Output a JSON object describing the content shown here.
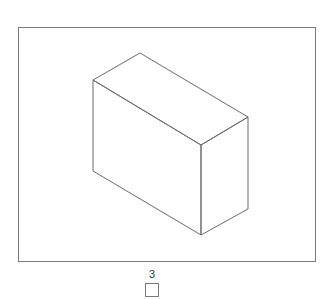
{
  "figure": {
    "stroke_color": "#6b6b6b",
    "frame_color": "#7a7a7a"
  },
  "option": {
    "label": "3",
    "checked": false
  }
}
